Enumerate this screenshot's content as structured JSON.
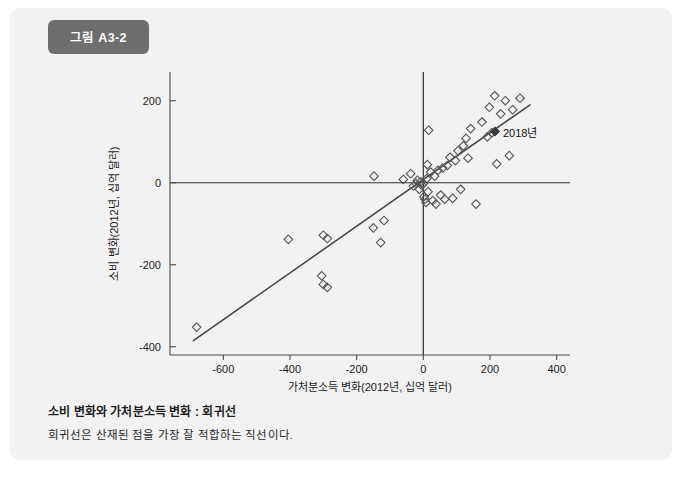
{
  "figure": {
    "badge_label": "그림 A3-2",
    "caption_title": "소비 변화와 가처분소득 변화 : 회귀선",
    "caption_subtitle": "회귀선은 산재된 점을 가장 잘 적합하는 직선이다.",
    "card_bg": "#f2f2f2",
    "badge_bg": "#6e6e6e"
  },
  "chart_data": {
    "type": "scatter",
    "title": "소비 변화와 가처분소득 변화 : 회귀선",
    "xlabel": "가처분소득 변화(2012년, 십억 달러)",
    "ylabel": "소비 변화(2012년, 십억 달러)",
    "xlim": [
      -760,
      440
    ],
    "ylim": [
      -420,
      270
    ],
    "xticks": [
      -600,
      -400,
      -200,
      0,
      200,
      400
    ],
    "xtick_labels": [
      "-600",
      "-400",
      "-200",
      "0",
      "200",
      "400"
    ],
    "yticks": [
      200,
      0,
      -200,
      -400
    ],
    "ytick_labels": [
      "200",
      "0",
      "-200",
      "-400"
    ],
    "grid": false,
    "legend": false,
    "zero_lines": {
      "x": 0,
      "y": 0
    },
    "marker": "open-diamond",
    "marker_color": "#555555",
    "line_color": "#4a4a4a",
    "regression_line": {
      "label": "회귀선",
      "x_start": -690,
      "y_start": -385,
      "x_end": 320,
      "y_end": 190
    },
    "annotations": [
      {
        "text": "2018년",
        "x": 215,
        "y": 125,
        "marker": "filled-diamond"
      }
    ],
    "points": [
      {
        "x": -680,
        "y": -352
      },
      {
        "x": -405,
        "y": -138
      },
      {
        "x": -300,
        "y": -128
      },
      {
        "x": -288,
        "y": -136
      },
      {
        "x": -305,
        "y": -227
      },
      {
        "x": -300,
        "y": -248
      },
      {
        "x": -288,
        "y": -255
      },
      {
        "x": -150,
        "y": -110
      },
      {
        "x": -128,
        "y": -146
      },
      {
        "x": -118,
        "y": -92
      },
      {
        "x": -148,
        "y": 16
      },
      {
        "x": -60,
        "y": 8
      },
      {
        "x": -38,
        "y": 22
      },
      {
        "x": -30,
        "y": -8
      },
      {
        "x": -22,
        "y": -2
      },
      {
        "x": -18,
        "y": 6
      },
      {
        "x": -12,
        "y": -16
      },
      {
        "x": -8,
        "y": 2
      },
      {
        "x": -5,
        "y": -6
      },
      {
        "x": 0,
        "y": -2
      },
      {
        "x": 2,
        "y": -34
      },
      {
        "x": 5,
        "y": -40
      },
      {
        "x": 8,
        "y": -48
      },
      {
        "x": 10,
        "y": 10
      },
      {
        "x": 12,
        "y": 44
      },
      {
        "x": 14,
        "y": -22
      },
      {
        "x": 16,
        "y": 128
      },
      {
        "x": 22,
        "y": 26
      },
      {
        "x": 28,
        "y": -44
      },
      {
        "x": 34,
        "y": 16
      },
      {
        "x": 38,
        "y": -52
      },
      {
        "x": 44,
        "y": 30
      },
      {
        "x": 52,
        "y": -30
      },
      {
        "x": 58,
        "y": 36
      },
      {
        "x": 64,
        "y": -40
      },
      {
        "x": 72,
        "y": 42
      },
      {
        "x": 80,
        "y": 62
      },
      {
        "x": 88,
        "y": -38
      },
      {
        "x": 96,
        "y": 54
      },
      {
        "x": 104,
        "y": 78
      },
      {
        "x": 112,
        "y": -16
      },
      {
        "x": 120,
        "y": 90
      },
      {
        "x": 128,
        "y": 108
      },
      {
        "x": 134,
        "y": 60
      },
      {
        "x": 142,
        "y": 132
      },
      {
        "x": 158,
        "y": -52
      },
      {
        "x": 176,
        "y": 148
      },
      {
        "x": 192,
        "y": 112
      },
      {
        "x": 198,
        "y": 184
      },
      {
        "x": 206,
        "y": 122
      },
      {
        "x": 214,
        "y": 212
      },
      {
        "x": 220,
        "y": 46
      },
      {
        "x": 232,
        "y": 168
      },
      {
        "x": 246,
        "y": 200
      },
      {
        "x": 258,
        "y": 66
      },
      {
        "x": 268,
        "y": 178
      },
      {
        "x": 290,
        "y": 206
      }
    ]
  }
}
